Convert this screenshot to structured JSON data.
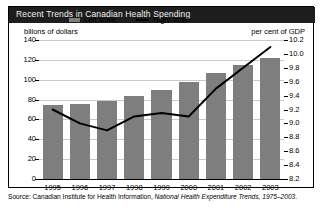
{
  "title": "Recent Trends in Canadian Health Spending",
  "left_axis_caption": "billons of dollars",
  "right_axis_caption": "per cent of GDP",
  "legend": {
    "bar_label": "Left scale",
    "line_label": "Right scale",
    "bar_color": "#7e7e7e",
    "line_color": "#000000"
  },
  "source": {
    "prefix": "Source: Canadian Institute for Health Information, ",
    "italic": "National Health Expenditure Trends, 1975–2003",
    "suffix": "."
  },
  "colors": {
    "title_bar": "#1d1d1d",
    "title_text": "#f2f2f2",
    "gridline": "#c9c9c9",
    "axis": "#000000",
    "background": "#ffffff"
  },
  "chart_data": {
    "type": "bar",
    "title": "Recent Trends in Canadian Health Spending",
    "xlabel": "",
    "ylabel": "billons of dollars",
    "y2label": "per cent of GDP",
    "grid": true,
    "legend_position": "top-inside",
    "categories": [
      "1995",
      "1996",
      "1997",
      "1998",
      "1999",
      "2000",
      "2001",
      "2002",
      "2003"
    ],
    "ylim": [
      0,
      140
    ],
    "yticks": [
      0,
      20,
      40,
      60,
      80,
      100,
      120,
      140
    ],
    "y2lim": [
      8.2,
      10.2
    ],
    "y2ticks": [
      8.2,
      8.4,
      8.6,
      8.8,
      9.0,
      9.2,
      9.4,
      9.6,
      9.8,
      10.0,
      10.2
    ],
    "series": [
      {
        "name": "Left scale",
        "type": "bar",
        "axis": "left",
        "unit": "billions of dollars",
        "values": [
          75,
          76,
          79,
          84,
          90,
          98,
          107,
          115,
          122
        ]
      },
      {
        "name": "Right scale",
        "type": "line",
        "axis": "right",
        "unit": "per cent of GDP",
        "values": [
          9.2,
          9.0,
          8.9,
          9.1,
          9.15,
          9.1,
          9.5,
          9.8,
          10.1
        ]
      }
    ]
  }
}
